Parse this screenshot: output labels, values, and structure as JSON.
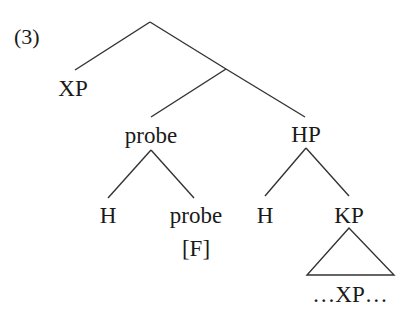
{
  "example_number": "(3)",
  "tree": {
    "root": {
      "label": "",
      "children": [
        {
          "label": "XP"
        },
        {
          "label": "",
          "children": [
            {
              "label": "probe",
              "children": [
                {
                  "label": "H"
                },
                {
                  "label": "probe",
                  "feature": "[F]"
                }
              ]
            },
            {
              "label": "HP",
              "children": [
                {
                  "label": "H"
                },
                {
                  "label": "KP",
                  "triangle": true,
                  "content": "…XP…"
                }
              ]
            }
          ]
        }
      ]
    }
  },
  "labels": {
    "xp": "XP",
    "probe_node": "probe",
    "hp": "HP",
    "probe_h": "H",
    "probe_head": "probe",
    "probe_feature": "[F]",
    "hp_h": "H",
    "kp": "KP",
    "kp_content": "…XP…"
  },
  "colors": {
    "line": "#333333",
    "text": "#1a1a1a",
    "background": "#ffffff"
  }
}
